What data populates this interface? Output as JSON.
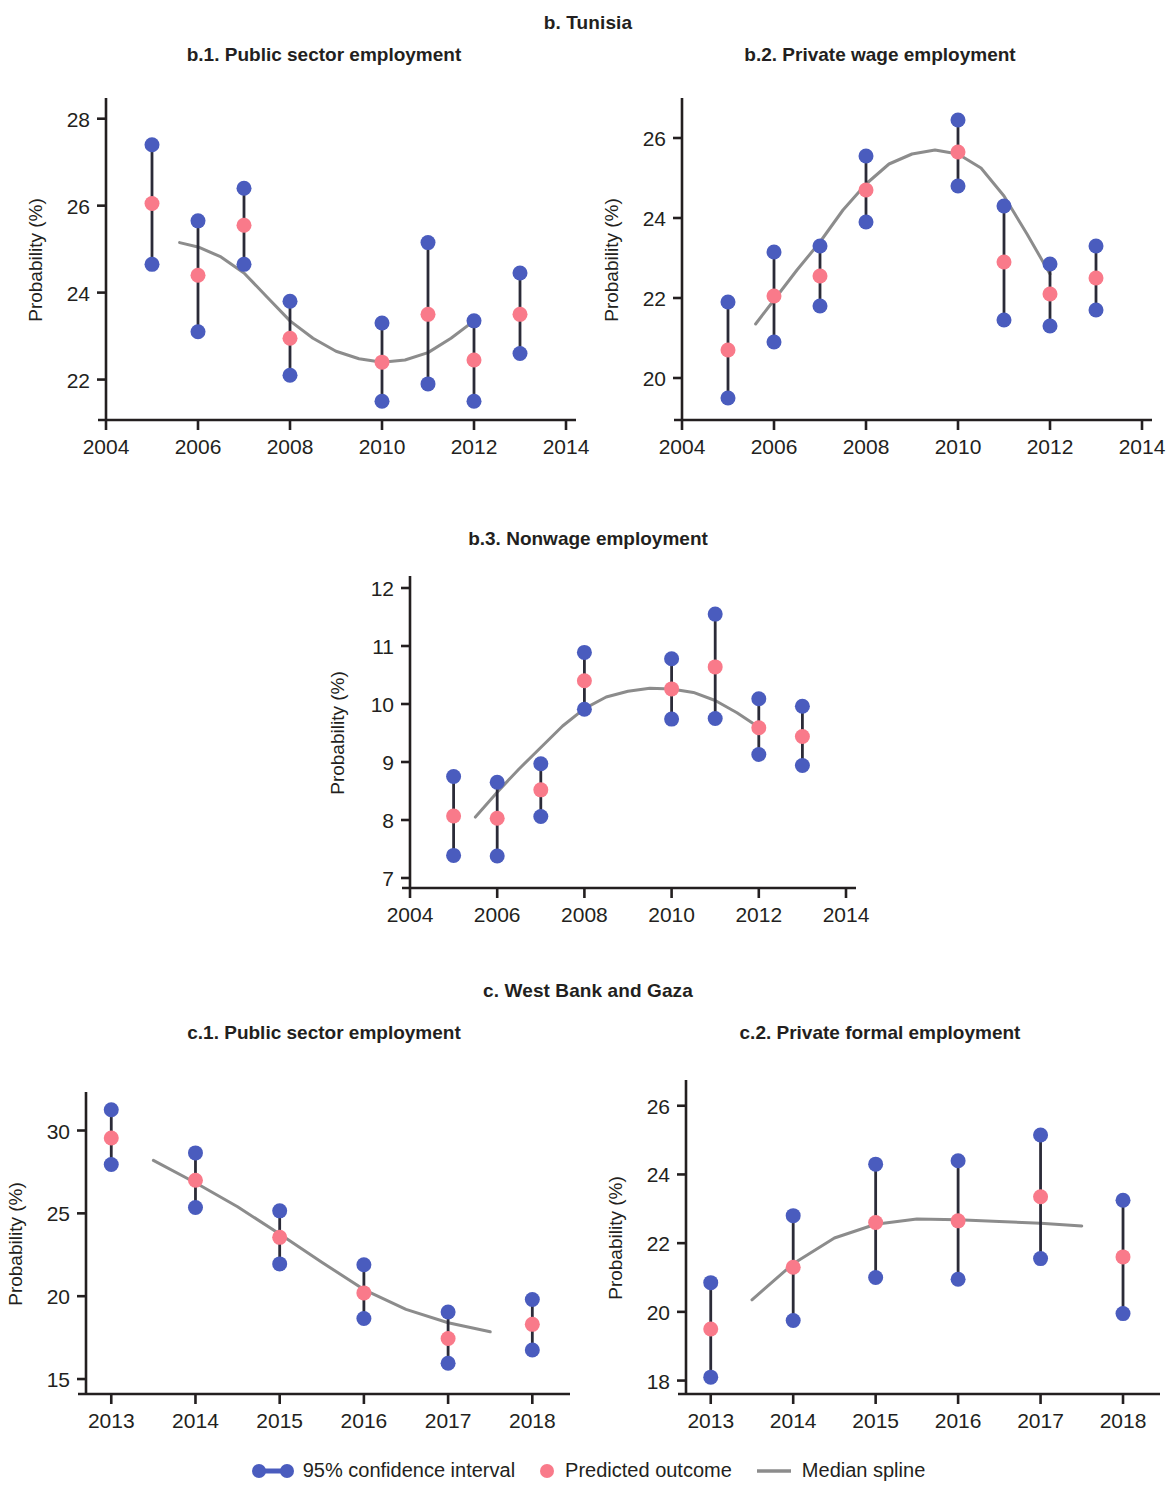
{
  "sections": [
    {
      "id": "b",
      "title": "b. Tunisia"
    },
    {
      "id": "c",
      "title": "c. West Bank and Gaza"
    }
  ],
  "legend": {
    "ci_label": "95% confidence interval",
    "predicted_label": "Predicted outcome",
    "spline_label": "Median spline",
    "ci_color": "#4a5cbe",
    "predicted_color": "#f97a8a",
    "spline_color": "#8c8c8c"
  },
  "axis": {
    "ylabel": "Probability (%)"
  },
  "chart_data": [
    {
      "id": "b1",
      "type": "scatter",
      "title": "b.1. Public sector employment",
      "xlabel": "",
      "ylabel": "Probability (%)",
      "xlim": [
        2004,
        2014
      ],
      "ylim": [
        21.3,
        28.2
      ],
      "xticks": [
        2004,
        2006,
        2008,
        2010,
        2012,
        2014
      ],
      "yticks": [
        22,
        24,
        26,
        28
      ],
      "x": [
        2005,
        2006,
        2007,
        2008,
        2010,
        2011,
        2012,
        2013
      ],
      "predicted": [
        26.05,
        24.4,
        25.55,
        22.95,
        22.4,
        23.5,
        22.45,
        23.5
      ],
      "ci_lower": [
        24.65,
        23.1,
        24.65,
        22.1,
        21.5,
        21.9,
        21.5,
        22.6
      ],
      "ci_upper": [
        27.4,
        25.65,
        26.4,
        23.8,
        23.3,
        25.15,
        23.35,
        24.45
      ],
      "spline": [
        [
          2005.6,
          25.15
        ],
        [
          2006.0,
          25.05
        ],
        [
          2006.5,
          24.82
        ],
        [
          2007.0,
          24.45
        ],
        [
          2007.5,
          23.9
        ],
        [
          2008.0,
          23.35
        ],
        [
          2008.5,
          22.95
        ],
        [
          2009.0,
          22.65
        ],
        [
          2009.5,
          22.48
        ],
        [
          2010.0,
          22.4
        ],
        [
          2010.5,
          22.45
        ],
        [
          2011.0,
          22.62
        ],
        [
          2011.5,
          22.95
        ],
        [
          2012.0,
          23.35
        ]
      ],
      "grid": false,
      "legend_position": "bottom"
    },
    {
      "id": "b2",
      "type": "scatter",
      "title": "b.2. Private wage employment",
      "xlabel": "",
      "ylabel": "Probability (%)",
      "xlim": [
        2004,
        2014
      ],
      "ylim": [
        19.2,
        26.7
      ],
      "xticks": [
        2004,
        2006,
        2008,
        2010,
        2012,
        2014
      ],
      "yticks": [
        20,
        22,
        24,
        26
      ],
      "x": [
        2005,
        2006,
        2007,
        2008,
        2010,
        2011,
        2012,
        2013
      ],
      "predicted": [
        20.7,
        22.05,
        22.55,
        24.7,
        25.65,
        22.9,
        22.1,
        22.5
      ],
      "ci_lower": [
        19.5,
        20.9,
        21.8,
        23.9,
        24.8,
        21.45,
        21.3,
        21.7
      ],
      "ci_upper": [
        21.9,
        23.15,
        23.3,
        25.55,
        26.45,
        24.3,
        22.85,
        23.3
      ],
      "spline": [
        [
          2005.6,
          21.35
        ],
        [
          2006.0,
          21.95
        ],
        [
          2006.5,
          22.7
        ],
        [
          2007.0,
          23.4
        ],
        [
          2007.5,
          24.2
        ],
        [
          2008.0,
          24.85
        ],
        [
          2008.5,
          25.35
        ],
        [
          2009.0,
          25.6
        ],
        [
          2009.5,
          25.7
        ],
        [
          2010.0,
          25.6
        ],
        [
          2010.5,
          25.25
        ],
        [
          2011.0,
          24.55
        ],
        [
          2011.5,
          23.6
        ],
        [
          2012.0,
          22.6
        ]
      ],
      "grid": false,
      "legend_position": "bottom"
    },
    {
      "id": "b3",
      "type": "scatter",
      "title": "b.3. Nonwage employment",
      "xlabel": "",
      "ylabel": "Probability (%)",
      "xlim": [
        2004,
        2014
      ],
      "ylim": [
        7,
        12
      ],
      "xticks": [
        2004,
        2006,
        2008,
        2010,
        2012,
        2014
      ],
      "yticks": [
        7,
        8,
        9,
        10,
        11,
        12
      ],
      "x": [
        2005,
        2006,
        2007,
        2008,
        2010,
        2011,
        2012,
        2013
      ],
      "predicted": [
        8.07,
        8.03,
        8.52,
        10.4,
        10.26,
        10.64,
        9.59,
        9.44
      ],
      "ci_lower": [
        7.39,
        7.38,
        8.06,
        9.91,
        9.74,
        9.75,
        9.13,
        8.94
      ],
      "ci_upper": [
        8.75,
        8.65,
        8.97,
        10.89,
        10.78,
        11.55,
        10.09,
        9.96
      ],
      "spline": [
        [
          2005.5,
          8.05
        ],
        [
          2006.0,
          8.48
        ],
        [
          2006.5,
          8.88
        ],
        [
          2007.0,
          9.25
        ],
        [
          2007.5,
          9.62
        ],
        [
          2008.0,
          9.92
        ],
        [
          2008.5,
          10.12
        ],
        [
          2009.0,
          10.22
        ],
        [
          2009.5,
          10.27
        ],
        [
          2010.0,
          10.26
        ],
        [
          2010.5,
          10.2
        ],
        [
          2011.0,
          10.06
        ],
        [
          2011.5,
          9.85
        ],
        [
          2012.0,
          9.6
        ]
      ],
      "grid": false,
      "legend_position": "bottom"
    },
    {
      "id": "c1",
      "type": "scatter",
      "title": "c.1. Public sector employment",
      "xlabel": "",
      "ylabel": "Probability (%)",
      "xlim": [
        2012.7,
        2018.4
      ],
      "ylim": [
        14.7,
        31.6
      ],
      "xticks": [
        2013,
        2014,
        2015,
        2016,
        2017,
        2018
      ],
      "yticks": [
        15,
        20,
        25,
        30
      ],
      "x": [
        2013,
        2014,
        2015,
        2016,
        2017,
        2018
      ],
      "predicted": [
        29.55,
        27.0,
        23.55,
        20.2,
        17.45,
        18.3
      ],
      "ci_lower": [
        27.95,
        25.35,
        21.95,
        18.65,
        15.95,
        16.75
      ],
      "ci_upper": [
        31.25,
        28.65,
        25.15,
        21.9,
        19.05,
        19.8
      ],
      "spline": [
        [
          2013.5,
          28.2
        ],
        [
          2014.0,
          26.85
        ],
        [
          2014.5,
          25.4
        ],
        [
          2015.0,
          23.75
        ],
        [
          2015.5,
          22.05
        ],
        [
          2016.0,
          20.4
        ],
        [
          2016.5,
          19.2
        ],
        [
          2017.0,
          18.4
        ],
        [
          2017.5,
          17.85
        ]
      ],
      "grid": false,
      "legend_position": "bottom"
    },
    {
      "id": "c2",
      "type": "scatter",
      "title": "c.2. Private formal employment",
      "xlabel": "",
      "ylabel": "Probability (%)",
      "xlim": [
        2012.7,
        2018.4
      ],
      "ylim": [
        17.9,
        26.4
      ],
      "xticks": [
        2013,
        2014,
        2015,
        2016,
        2017,
        2018
      ],
      "yticks": [
        18,
        20,
        22,
        24,
        26
      ],
      "x": [
        2013,
        2014,
        2015,
        2016,
        2017,
        2018
      ],
      "predicted": [
        19.5,
        21.3,
        22.6,
        22.65,
        23.35,
        21.6
      ],
      "ci_lower": [
        18.1,
        19.75,
        21.0,
        20.95,
        21.55,
        19.95
      ],
      "ci_upper": [
        20.85,
        22.8,
        24.3,
        24.4,
        25.15,
        23.25
      ],
      "spline": [
        [
          2013.5,
          20.35
        ],
        [
          2014.0,
          21.4
        ],
        [
          2014.5,
          22.15
        ],
        [
          2015.0,
          22.55
        ],
        [
          2015.5,
          22.7
        ],
        [
          2016.0,
          22.68
        ],
        [
          2016.5,
          22.63
        ],
        [
          2017.0,
          22.58
        ],
        [
          2017.5,
          22.5
        ]
      ],
      "grid": false,
      "legend_position": "bottom"
    }
  ]
}
